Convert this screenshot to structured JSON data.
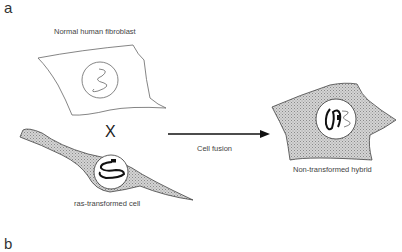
{
  "panels": {
    "a": {
      "label": "a"
    },
    "b": {
      "label": "b"
    }
  },
  "cells": {
    "normal": {
      "label": "Normal human fibroblast"
    },
    "ras": {
      "label": "ras-transformed cell"
    },
    "hybrid": {
      "label": "Non-transformed hybrid"
    }
  },
  "operator": {
    "cross": "X"
  },
  "arrow": {
    "label": "Cell fusion"
  },
  "colors": {
    "cell_fill": "#b8b8b8",
    "outline": "#555555",
    "chromosome": "#111111"
  }
}
